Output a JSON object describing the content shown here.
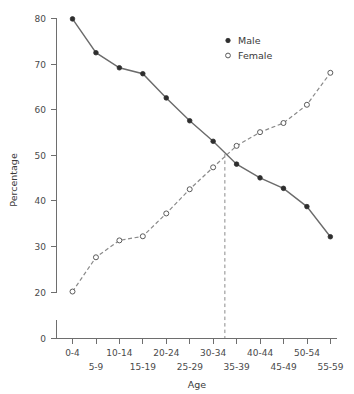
{
  "chart_data": {
    "type": "line",
    "title": "",
    "xlabel": "Age",
    "ylabel": "Percentage",
    "categories": [
      "0-4",
      "5-9",
      "10-14",
      "15-19",
      "20-24",
      "25-29",
      "30-34",
      "35-39",
      "40-44",
      "45-49",
      "50-54",
      "55-59"
    ],
    "series": [
      {
        "name": "Male",
        "values": [
          79.8,
          72.4,
          69.1,
          67.8,
          62.5,
          57.5,
          53.0,
          48.0,
          45.0,
          42.7,
          38.7,
          32.1
        ]
      },
      {
        "name": "Female",
        "values": [
          20.1,
          27.6,
          31.3,
          32.2,
          37.2,
          42.5,
          47.3,
          52.0,
          55.0,
          57.0,
          61.0,
          68.0
        ]
      }
    ],
    "ylim": [
      0,
      80
    ],
    "yticks": [
      0,
      20,
      30,
      40,
      50,
      60,
      70,
      80
    ],
    "ytick_labels": [
      "0",
      "20",
      "30",
      "40",
      "50",
      "60",
      "70",
      "80"
    ],
    "grid": false,
    "legend_position": "upper right",
    "annotations": [
      {
        "type": "vertical-dashed-line",
        "at_category_index": 6.5,
        "from_value": 50.2,
        "to_value": 0,
        "label": "crossover at 50%"
      }
    ]
  },
  "axes": {
    "y_title": "Percentage",
    "x_title": "Age",
    "y_tick_labels": [
      "80",
      "70",
      "60",
      "50",
      "40",
      "30",
      "20",
      "0"
    ],
    "x_tick_labels_row1": [
      "0-4",
      "10-14",
      "20-24",
      "30-34",
      "40-44",
      "50-54"
    ],
    "x_tick_labels_row2": [
      "5-9",
      "15-19",
      "25-29",
      "35-39",
      "45-49",
      "55-59"
    ]
  },
  "legend": {
    "entries": [
      {
        "label": "Male",
        "marker": "filled-circle-icon",
        "color": "#2e2e2e"
      },
      {
        "label": "Female",
        "marker": "open-circle-icon",
        "color": "#5a5a5a"
      }
    ]
  },
  "colors": {
    "male_line": "#6b6b6b",
    "female_line": "#8a8a8a",
    "axis": "#6e6e6e",
    "text": "#3a3a3a",
    "background": "#ffffff"
  }
}
